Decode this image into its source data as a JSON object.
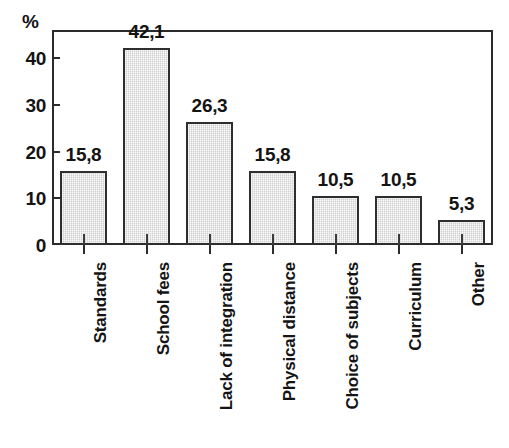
{
  "chart_data": {
    "type": "bar",
    "title": "",
    "subtitle": "",
    "xlabel": "",
    "ylabel": "%",
    "ylim": [
      0,
      46
    ],
    "yticks": [
      0,
      10,
      20,
      30,
      40
    ],
    "ytick_labels": [
      "0",
      "10",
      "20",
      "30",
      "40"
    ],
    "grid": false,
    "legend": false,
    "decimal_separator": ",",
    "categories": [
      "Standards",
      "School fees",
      "Lack of integration",
      "Physical distance",
      "Choice of subjects",
      "Curriculum",
      "Other"
    ],
    "values": [
      15.8,
      42.1,
      26.3,
      15.8,
      10.5,
      10.5,
      5.3
    ],
    "data_labels": [
      "15,8",
      "42,1",
      "26,3",
      "15,8",
      "10,5",
      "10,5",
      "5,3"
    ],
    "colors": {
      "bar_fill": "#dedede",
      "bar_border": "#2e2e2e",
      "axis": "#2b2b2b",
      "text": "#141414",
      "background": "#ffffff"
    }
  },
  "axis": {
    "y_unit_label": "%"
  }
}
